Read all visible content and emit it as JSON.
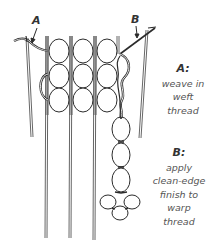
{
  "figure": {
    "type": "instructional-illustration"
  },
  "callouts": {
    "a": {
      "letter": "A"
    },
    "b": {
      "letter": "B"
    }
  },
  "captions": {
    "a": {
      "title": "A:",
      "lines": [
        "weave in",
        "weft",
        "thread"
      ]
    },
    "b": {
      "title": "B:",
      "lines": [
        "apply",
        "clean-edge",
        "finish to",
        "warp",
        "thread"
      ]
    }
  },
  "colors": {
    "line": "#2b2b2b",
    "warp": "#555555",
    "text": "#555555",
    "background": "#ffffff"
  }
}
